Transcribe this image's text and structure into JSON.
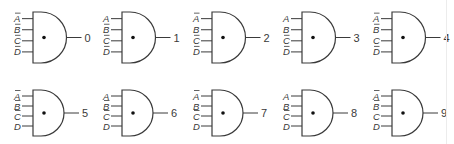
{
  "diagram": {
    "colors": {
      "stroke": "#3a3a3a",
      "background": "#ffffff"
    },
    "gates": [
      {
        "output": "0",
        "inputs": [
          {
            "name": "A",
            "bar": true
          },
          {
            "name": "B",
            "bar": true
          },
          {
            "name": "C",
            "bar": true
          },
          {
            "name": "D",
            "bar": true
          }
        ]
      },
      {
        "output": "1",
        "inputs": [
          {
            "name": "A",
            "bar": false
          },
          {
            "name": "B",
            "bar": true
          },
          {
            "name": "C",
            "bar": true
          },
          {
            "name": "D",
            "bar": true
          }
        ]
      },
      {
        "output": "2",
        "inputs": [
          {
            "name": "A",
            "bar": true
          },
          {
            "name": "B",
            "bar": false
          },
          {
            "name": "C",
            "bar": true
          },
          {
            "name": "D",
            "bar": true
          }
        ]
      },
      {
        "output": "3",
        "inputs": [
          {
            "name": "A",
            "bar": false
          },
          {
            "name": "B",
            "bar": false
          },
          {
            "name": "C",
            "bar": true
          },
          {
            "name": "D",
            "bar": true
          }
        ]
      },
      {
        "output": "4",
        "inputs": [
          {
            "name": "A",
            "bar": true
          },
          {
            "name": "B",
            "bar": true
          },
          {
            "name": "C",
            "bar": false
          },
          {
            "name": "D",
            "bar": true
          }
        ]
      },
      {
        "output": "5",
        "inputs": [
          {
            "name": "A",
            "bar": true
          },
          {
            "name": "B",
            "bar": true
          },
          {
            "name": "C",
            "bar": true
          },
          {
            "name": "D",
            "bar": false
          }
        ]
      },
      {
        "output": "6",
        "inputs": [
          {
            "name": "A",
            "bar": false
          },
          {
            "name": "B",
            "bar": true
          },
          {
            "name": "C",
            "bar": true
          },
          {
            "name": "D",
            "bar": false
          }
        ]
      },
      {
        "output": "7",
        "inputs": [
          {
            "name": "A",
            "bar": true
          },
          {
            "name": "B",
            "bar": false
          },
          {
            "name": "C",
            "bar": true
          },
          {
            "name": "D",
            "bar": false
          }
        ]
      },
      {
        "output": "8",
        "inputs": [
          {
            "name": "A",
            "bar": false
          },
          {
            "name": "B",
            "bar": false
          },
          {
            "name": "C",
            "bar": true
          },
          {
            "name": "D",
            "bar": false
          }
        ]
      },
      {
        "output": "9",
        "inputs": [
          {
            "name": "A",
            "bar": true
          },
          {
            "name": "B",
            "bar": true
          },
          {
            "name": "C",
            "bar": false
          },
          {
            "name": "D",
            "bar": false
          }
        ]
      }
    ]
  }
}
